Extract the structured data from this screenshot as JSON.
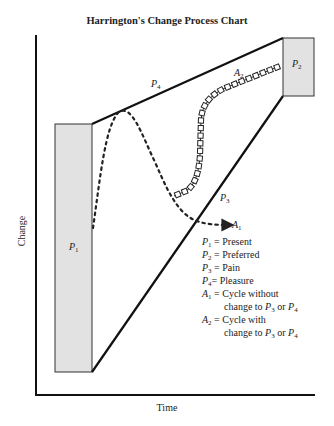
{
  "chart_data": {
    "type": "diagram",
    "title": "Harrington's Change Process Chart",
    "xlabel": "Time",
    "ylabel": "Change",
    "boxes": [
      {
        "id": "P1",
        "label": "P",
        "sub": "1"
      },
      {
        "id": "P2",
        "label": "P",
        "sub": "2"
      }
    ],
    "lines": [
      {
        "id": "P3",
        "label": "P",
        "sub": "3",
        "from": "P1-bottom",
        "to": "P2-bottom"
      },
      {
        "id": "P4",
        "label": "P",
        "sub": "4",
        "from": "P1-top",
        "to": "P2-top"
      }
    ],
    "paths": [
      {
        "id": "A1",
        "label": "A",
        "sub": "1",
        "style": "dotted-arrow",
        "description": "Cycle without change to P3 or P4"
      },
      {
        "id": "A2",
        "label": "A",
        "sub": "2",
        "style": "square-chain",
        "description": "Cycle with change to P3 or P4"
      }
    ],
    "legend": [
      {
        "sym": "P",
        "sub": "1",
        "text": " = Present"
      },
      {
        "sym": "P",
        "sub": "2",
        "text": " = Preferred"
      },
      {
        "sym": "P",
        "sub": "3",
        "text": " = Pain"
      },
      {
        "sym": "P",
        "sub": "4",
        "text": "= Pleasure"
      },
      {
        "sym": "A",
        "sub": "1",
        "text": " = Cycle without",
        "cont": "change to P3 or P4"
      },
      {
        "sym": "A",
        "sub": "2",
        "text": " = Cycle with",
        "cont": "change to P3 or P4"
      }
    ]
  },
  "labels": {
    "title": "Harrington's Change Process Chart",
    "xlabel": "Time",
    "ylabel": "Change",
    "P": "P",
    "A": "A",
    "s1": "1",
    "s2": "2",
    "s3": "3",
    "s4": "4",
    "eq_present": " = Present",
    "eq_preferred": " = Preferred",
    "eq_pain": " = Pain",
    "eq_pleasure": "= Pleasure",
    "eq_a1": " = Cycle without",
    "eq_a2": " = Cycle with",
    "change_to": "change to ",
    "or": " or "
  }
}
